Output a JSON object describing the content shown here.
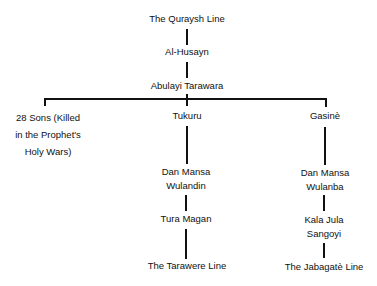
{
  "tree": {
    "root": "The Quraysh Line",
    "gen1": "Al-Husayn",
    "gen2": "Abulayi Tarawara",
    "branches": {
      "left": {
        "line1": "28 Sons (Killed",
        "line2": "in the Prophet's",
        "line3": "Holy Wars)"
      },
      "middle": {
        "name": "Tukuru",
        "child1_line1": "Dan Mansa",
        "child1_line2": "Wulandin",
        "child2": "Tura Magan",
        "child3": "The Tarawere Line"
      },
      "right": {
        "name": "Gasinè",
        "child1_line1": "Dan Mansa",
        "child1_line2": "Wulanba",
        "child2_line1": "Kala Jula",
        "child2_line2": "Sangoyi",
        "child3": "The Jabagatè Line"
      }
    }
  }
}
